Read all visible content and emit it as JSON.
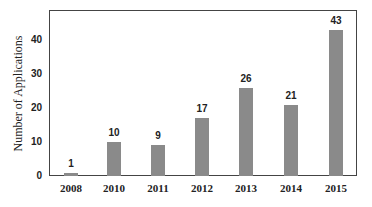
{
  "chart_data": {
    "type": "bar",
    "title": "",
    "xlabel": "",
    "ylabel": "Number of Applications",
    "categories": [
      "2008",
      "2010",
      "2011",
      "2012",
      "2013",
      "2014",
      "2015"
    ],
    "values": [
      1,
      10,
      9,
      17,
      26,
      21,
      43
    ],
    "data_labels": [
      "1",
      "10",
      "9",
      "17",
      "26",
      "21",
      "43"
    ],
    "yticks": [
      "0",
      "10",
      "20",
      "30",
      "40"
    ],
    "ylim": [
      0,
      48.8
    ],
    "grid": false,
    "legend": null,
    "bar_color": "#8a8a8a"
  }
}
